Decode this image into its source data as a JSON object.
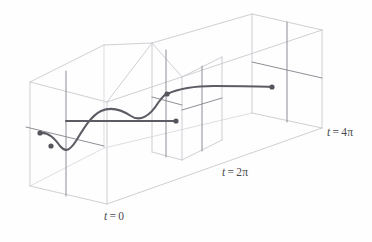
{
  "figure": {
    "kind": "3d-box-diagram",
    "title": "",
    "width": 372,
    "height": 242,
    "background": "#fefefe"
  },
  "colors": {
    "box_edge": "#c9c9cf",
    "box_edge_hidden": "#d8d8de",
    "cross_axis": "#8e8e96",
    "curve": "#5c5c64",
    "dot": "#55555d",
    "label_text": "#4a4a50"
  },
  "labels": [
    {
      "id": "t0",
      "variable": "t",
      "equals": "=",
      "value": "0",
      "full": "t = 0",
      "x": 104,
      "y": 210
    },
    {
      "id": "t2pi",
      "variable": "t",
      "equals": "=",
      "value": "2π",
      "full": "t = 2π",
      "x": 222,
      "y": 166
    },
    {
      "id": "t4pi",
      "variable": "t",
      "equals": "=",
      "value": "4π",
      "full": "t = 4π",
      "x": 327,
      "y": 126
    }
  ],
  "chart_data": {
    "type": "line",
    "title": "",
    "xlabel": "t",
    "ylabel": "",
    "axis_ticks": [
      "t = 0",
      "t = 2π",
      "t = 4π"
    ],
    "marked_points": [
      {
        "name": "initial-point-upper",
        "x": 40,
        "y": 133
      },
      {
        "name": "initial-point-lower",
        "x": 51,
        "y": 146
      },
      {
        "name": "crossing-point-2pi",
        "x": 167,
        "y": 94
      },
      {
        "name": "endpoint-mid-segment",
        "x": 176,
        "y": 121
      },
      {
        "name": "endpoint-right",
        "x": 272,
        "y": 87
      }
    ],
    "curve_segments": [
      {
        "name": "main-solution-curve",
        "path": "M 40,133 C 49,132 55,139 60,146 C 66,153 70,150 76,141 C 84,128 91,116 101,111 C 112,106 122,110 131,116 C 140,122 150,116 158,103 C 163,96 166,94 167,94"
      },
      {
        "name": "upper-right-segment",
        "path": "M 167,94 C 180,88 196,86 214,86 C 236,86 258,86 272,87"
      },
      {
        "name": "horizontal-mid-segment",
        "path": "M 66,121 L 176,121"
      }
    ],
    "grid": false,
    "legend": null
  },
  "geometry": {
    "box": {
      "name": "outer-prism",
      "vertices": {
        "front_bottom_left": [
          30,
          186
        ],
        "front_bottom_right": [
          107,
          204
        ],
        "back_bottom_left": [
          30,
          186
        ],
        "front_top_left": [
          30,
          82
        ],
        "front_top_right": [
          107,
          102
        ],
        "back_top_left": [
          104,
          45
        ],
        "back_top_right": [
          152,
          43
        ],
        "right_front_top": [
          322,
          30
        ],
        "right_front_bottom": [
          322,
          128
        ],
        "right_back_top": [
          252,
          14
        ],
        "far_bottom_right": [
          252,
          113
        ]
      }
    },
    "cross_sections": [
      {
        "name": "plane-t0",
        "label": "t = 0"
      },
      {
        "name": "plane-t2pi",
        "label": "t = 2π"
      },
      {
        "name": "plane-t4pi",
        "label": "t = 4π"
      }
    ]
  }
}
